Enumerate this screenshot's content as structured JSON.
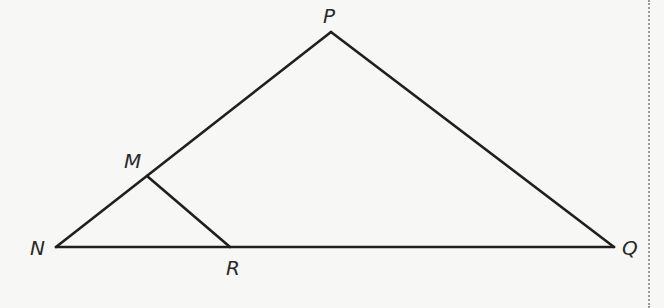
{
  "diagram": {
    "type": "geometry-triangle",
    "stroke_color": "#1f1f1f",
    "background": "#f7f7f6",
    "points": {
      "P": {
        "label": "P",
        "x": 331,
        "y": 32
      },
      "M": {
        "label": "M",
        "x": 147,
        "y": 176
      },
      "N": {
        "label": "N",
        "x": 56,
        "y": 247
      },
      "R": {
        "label": "R",
        "x": 230,
        "y": 247
      },
      "Q": {
        "label": "Q",
        "x": 614,
        "y": 247
      }
    },
    "segments": [
      [
        "N",
        "P"
      ],
      [
        "P",
        "Q"
      ],
      [
        "N",
        "Q"
      ],
      [
        "M",
        "R"
      ]
    ],
    "labels": {
      "P": "P",
      "M": "M",
      "N": "N",
      "R": "R",
      "Q": "Q"
    }
  }
}
